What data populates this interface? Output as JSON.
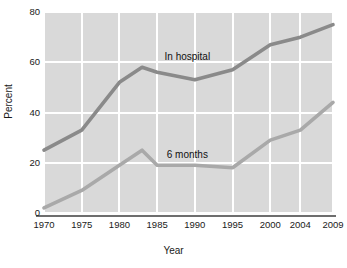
{
  "chart_data": {
    "type": "line",
    "title": "",
    "xlabel": "Year",
    "ylabel": "Percent",
    "ylim": [
      0,
      80
    ],
    "yticks": [
      0,
      20,
      40,
      60,
      80
    ],
    "categories": [
      1970,
      1975,
      1980,
      1983,
      1985,
      1990,
      1995,
      2000,
      2004,
      2009
    ],
    "xticks": [
      "1970",
      "1975",
      "1980",
      "1985",
      "1990",
      "1995",
      "2000",
      "2004",
      "2009"
    ],
    "grid": true,
    "legend_position": "inline-annotation",
    "series": [
      {
        "name": "In hospital",
        "color": "#8a8a8a",
        "x": [
          1970,
          1975,
          1980,
          1983,
          1985,
          1990,
          1995,
          2000,
          2004,
          2009
        ],
        "values": [
          25,
          33,
          52,
          58,
          56,
          53,
          57,
          67,
          70,
          75
        ]
      },
      {
        "name": "6 months",
        "color": "#a9a9a9",
        "x": [
          1970,
          1975,
          1980,
          1983,
          1985,
          1990,
          1995,
          2000,
          2004,
          2009
        ],
        "values": [
          2,
          9,
          19,
          25,
          19,
          19,
          18,
          29,
          33,
          44
        ]
      }
    ],
    "annotations": [
      {
        "text": "In hospital",
        "x": 1989,
        "y": 62
      },
      {
        "text": "6 months",
        "x": 1989,
        "y": 23
      }
    ]
  },
  "axes": {
    "y_title": "Percent",
    "x_title": "Year",
    "y_tick_labels": [
      "80",
      "60",
      "40",
      "20",
      "0"
    ],
    "x_tick_labels": [
      "1970",
      "1975",
      "1980",
      "1985",
      "1990",
      "1995",
      "2000",
      "2004",
      "2009"
    ]
  },
  "labels": {
    "in_hospital": "In hospital",
    "six_months": "6 months"
  },
  "colors": {
    "plot_background": "#d9d9d9",
    "gridline": "#ffffff",
    "axis_line": "#6e6e6e",
    "series_in_hospital": "#8a8a8a",
    "series_six_months": "#a9a9a9",
    "text": "#1a1a1a"
  }
}
